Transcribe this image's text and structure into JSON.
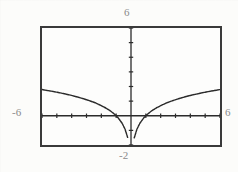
{
  "screen": {
    "device": "graphing-calculator-screen",
    "labels": {
      "top": "6",
      "bottom": "-2",
      "left": "-6",
      "right": "6"
    }
  },
  "chart_data": {
    "type": "line",
    "title": "",
    "xlabel": "",
    "ylabel": "",
    "xlim": [
      -6,
      6
    ],
    "ylim": [
      -2,
      6
    ],
    "grid": false,
    "legend": null,
    "axis_labels_shown": {
      "ymax": "6",
      "ymin": "-2",
      "xmin": "-6",
      "xmax": "6"
    },
    "x_tick_count": 12,
    "y_tick_count": 8,
    "tick_spacing": 1,
    "style": "dotted-pixel-trace",
    "color": "#2b2b2b",
    "series": [
      {
        "name": "y",
        "x": [
          -6.0,
          -5.6,
          -5.2,
          -4.8,
          -4.4,
          -4.0,
          -3.6,
          -3.2,
          -2.8,
          -2.4,
          -2.0,
          -1.7,
          -1.4,
          -1.1,
          -0.85,
          -0.6,
          -0.4,
          -0.22,
          -0.1,
          -0.03,
          0.0,
          0.03,
          0.1,
          0.22,
          0.4,
          0.6,
          0.85,
          1.1,
          1.4,
          1.7,
          2.0,
          2.4,
          2.8,
          3.2,
          3.6,
          4.0,
          4.4,
          4.8,
          5.2,
          5.6,
          6.0
        ],
        "y": [
          1.79,
          1.72,
          1.65,
          1.57,
          1.48,
          1.39,
          1.28,
          1.16,
          1.03,
          0.88,
          0.69,
          0.53,
          0.34,
          0.1,
          -0.16,
          -0.51,
          -0.92,
          -1.51,
          -2.0,
          -2.0,
          -2.0,
          -2.0,
          -2.0,
          -1.51,
          -0.92,
          -0.51,
          -0.16,
          0.1,
          0.34,
          0.53,
          0.69,
          0.88,
          1.03,
          1.16,
          1.28,
          1.39,
          1.48,
          1.57,
          1.65,
          1.72,
          1.79
        ]
      }
    ]
  }
}
